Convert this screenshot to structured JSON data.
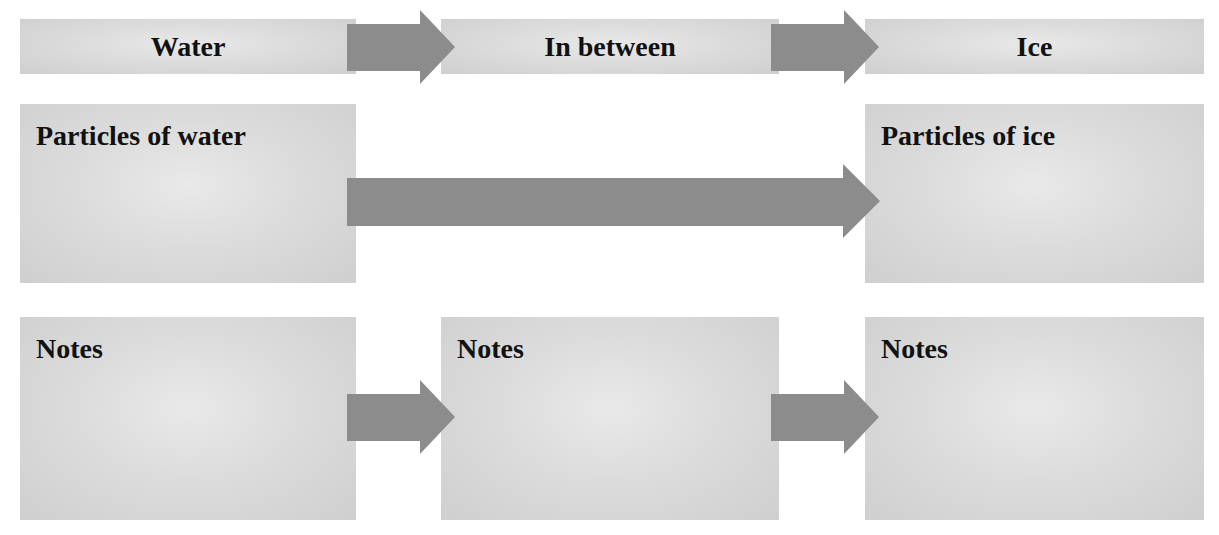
{
  "diagram": {
    "title_row": {
      "stages": [
        {
          "label": "Water"
        },
        {
          "label": "In between"
        },
        {
          "label": "Ice"
        }
      ]
    },
    "particles_row": {
      "left_label": "Particles of water",
      "right_label": "Particles of ice"
    },
    "notes_row": {
      "panels": [
        {
          "label": "Notes"
        },
        {
          "label": "Notes"
        },
        {
          "label": "Notes"
        }
      ]
    },
    "colors": {
      "box_fill": "#d9d9d9",
      "arrow_fill": "#8c8c8c",
      "text": "#111111",
      "background": "#ffffff"
    }
  }
}
